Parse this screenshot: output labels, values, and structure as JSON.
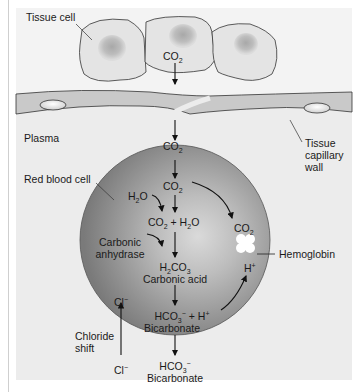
{
  "diagram": {
    "labels": {
      "tissue_cell": "Tissue cell",
      "plasma": "Plasma",
      "tissue_capillary_wall": "Tissue capillary wall",
      "tissue_capillary_wall_lines": [
        "Tissue",
        "capillary",
        "wall"
      ],
      "red_blood_cell": "Red blood cell",
      "carbonic_anhydrase_lines": [
        "Carbonic",
        "anhydrase"
      ],
      "hemoglobin": "Hemoglobin",
      "chloride_shift_lines": [
        "Chloride",
        "shift"
      ],
      "carbonic_acid": "Carbonic acid",
      "bicarbonate_inside": "Bicarbonate",
      "bicarbonate_outside": "Bicarbonate"
    },
    "formulas": {
      "co2_tissue": {
        "base": "CO",
        "sub": "2"
      },
      "co2_plasma": {
        "base": "CO",
        "sub": "2"
      },
      "co2_rbc": {
        "base": "CO",
        "sub": "2"
      },
      "h2o": {
        "a": "H",
        "sub": "2",
        "b": "O"
      },
      "co2_plus_h2o": {
        "a": "CO",
        "sub1": "2",
        "mid": " + H",
        "sub2": "2",
        "b": "O"
      },
      "h2co3": {
        "a": "H",
        "sub1": "2",
        "b": "CO",
        "sub2": "3"
      },
      "hco3_plus_h": {
        "a": "HCO",
        "sub": "3",
        "sup": "−",
        "mid": "  +  H",
        "sup2": "+"
      },
      "co2_hemoglobin": {
        "base": "CO",
        "sub": "2"
      },
      "h_plus": {
        "base": "H",
        "sup": "+"
      },
      "cl_inside": {
        "base": "Cl",
        "sup": "−"
      },
      "cl_outside": {
        "base": "Cl",
        "sup": "−"
      },
      "hco3_outside": {
        "a": "HCO",
        "sub": "3",
        "sup": "−"
      }
    },
    "colors": {
      "background": "#f3f3f3",
      "plasma": "#ececec",
      "cell_fill": "#e3e3e3",
      "nucleus": "#b8b8b8",
      "capillary_wall": "#c8c8c8",
      "rbc_dark": "#7f7f7f",
      "rbc_light": "#d4d4d4",
      "text": "#1a1a1a"
    }
  }
}
